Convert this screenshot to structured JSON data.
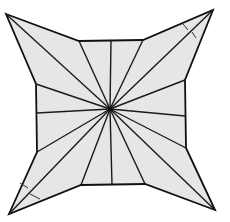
{
  "diagram": {
    "type": "geometric-figure",
    "colors": {
      "fill": "#e6e6e6",
      "stroke": "#111111",
      "background": "#ffffff"
    },
    "center": [
      110,
      109
    ],
    "outline": [
      [
        6,
        14
      ],
      [
        79,
        41
      ],
      [
        143,
        40
      ],
      [
        213,
        10
      ],
      [
        185,
        80
      ],
      [
        186,
        148
      ],
      [
        215,
        210
      ],
      [
        145,
        184
      ],
      [
        81,
        185
      ],
      [
        9,
        214
      ],
      [
        37,
        152
      ],
      [
        36,
        84
      ]
    ],
    "edge_midpoints": [
      [
        111,
        41
      ],
      [
        185,
        116
      ],
      [
        112,
        185
      ],
      [
        37,
        113
      ]
    ],
    "tick_marks": [
      {
        "near": "top-right-tip",
        "segments": [
          [
            [
              183,
              24
            ],
            [
              188,
              30
            ]
          ],
          [
            [
              192,
              32
            ],
            [
              196,
              38
            ]
          ]
        ]
      },
      {
        "near": "bottom-left-tip",
        "segments": [
          [
            [
              20,
              183
            ],
            [
              28,
              188
            ]
          ],
          [
            [
              30,
              194
            ],
            [
              40,
              199
            ]
          ]
        ]
      }
    ]
  }
}
